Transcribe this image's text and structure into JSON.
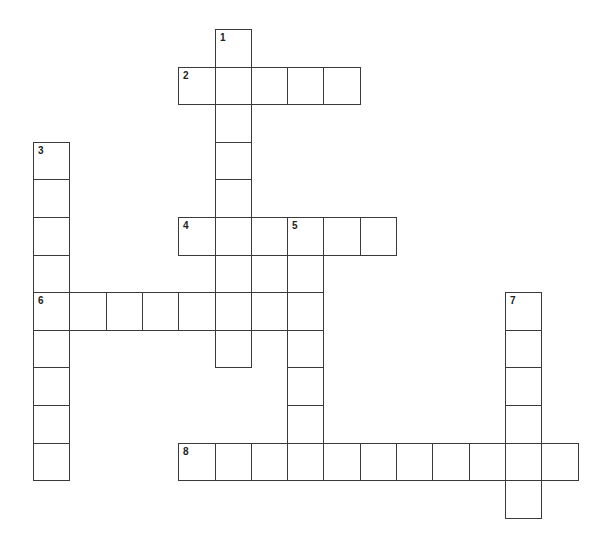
{
  "puzzle": {
    "type": "crossword",
    "grid": {
      "origin_x": 33,
      "origin_y": 29,
      "cell_w": 36.3,
      "cell_h": 37.6,
      "line_color": "#3a3a3a",
      "background": "#ffffff"
    },
    "entries": [
      {
        "number": "1",
        "direction": "down",
        "row": 0,
        "col": 5,
        "length": 9
      },
      {
        "number": "2",
        "direction": "across",
        "row": 1,
        "col": 4,
        "length": 5
      },
      {
        "number": "3",
        "direction": "down",
        "row": 3,
        "col": 0,
        "length": 9
      },
      {
        "number": "4",
        "direction": "across",
        "row": 5,
        "col": 4,
        "length": 6
      },
      {
        "number": "5",
        "direction": "down",
        "row": 5,
        "col": 7,
        "length": 7
      },
      {
        "number": "6",
        "direction": "across",
        "row": 7,
        "col": 0,
        "length": 8
      },
      {
        "number": "7",
        "direction": "down",
        "row": 7,
        "col": 13,
        "length": 6
      },
      {
        "number": "8",
        "direction": "across",
        "row": 11,
        "col": 4,
        "length": 11
      }
    ]
  }
}
